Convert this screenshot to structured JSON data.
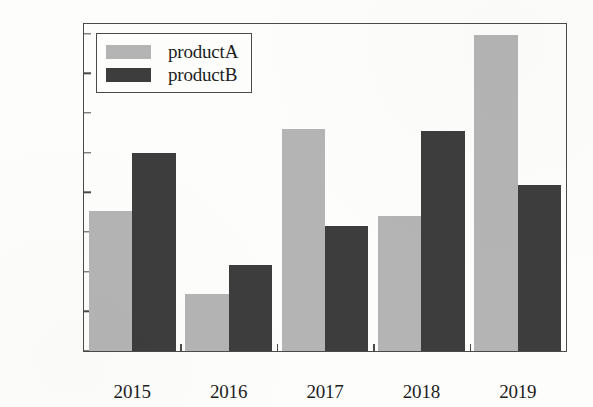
{
  "chart_data": {
    "type": "bar",
    "title": "",
    "xlabel": "",
    "ylabel": "",
    "categories": [
      "2015",
      "2016",
      "2017",
      "2018",
      "2019"
    ],
    "series": [
      {
        "name": "productA",
        "color": "#b4b4b4",
        "values": [
          177000,
          72000,
          280000,
          170000,
          398000
        ]
      },
      {
        "name": "productB",
        "color": "#3d3d3d",
        "values": [
          249000,
          108000,
          158000,
          277000,
          209000
        ]
      }
    ],
    "ylim": [
      0,
      412000
    ],
    "yticks": [
      0,
      50000,
      100000,
      150000,
      200000,
      250000,
      300000,
      350000,
      400000
    ],
    "ytick_labels": [
      "0",
      "50000",
      "100000",
      "150000",
      "200000",
      "250000",
      "300000",
      "350000",
      "400000"
    ],
    "grid": false,
    "legend_position": "upper left",
    "legend_entries": [
      "productA",
      "productB"
    ]
  }
}
